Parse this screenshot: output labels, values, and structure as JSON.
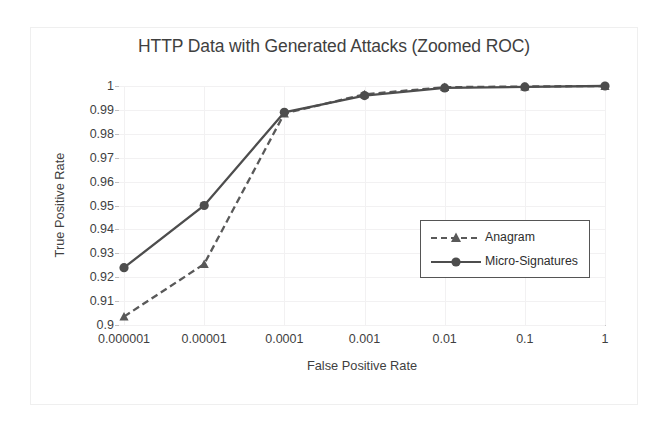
{
  "chart_data": {
    "type": "line",
    "title": "HTTP Data with Generated Attacks (Zoomed ROC)",
    "xlabel": "False Positive Rate",
    "ylabel": "True Positive Rate",
    "xscale": "log",
    "x": [
      1e-06,
      1e-05,
      0.0001,
      0.001,
      0.01,
      0.1,
      1
    ],
    "xtick_labels": [
      "0.000001",
      "0.00001",
      "0.0001",
      "0.001",
      "0.01",
      "0.1",
      "1"
    ],
    "ytick_labels": [
      "1",
      "0.99",
      "0.98",
      "0.97",
      "0.96",
      "0.95",
      "0.94",
      "0.93",
      "0.92",
      "0.91",
      "0.9"
    ],
    "ytick_values": [
      1,
      0.99,
      0.98,
      0.97,
      0.96,
      0.95,
      0.94,
      0.93,
      0.92,
      0.91,
      0.9
    ],
    "ylim": [
      0.9,
      1.0
    ],
    "grid": true,
    "legend_position": "center-right",
    "series": [
      {
        "name": "Anagram",
        "linestyle": "dashed",
        "marker": "triangle",
        "color": "#595959",
        "values": [
          0.9035,
          0.9255,
          0.9885,
          0.9965,
          0.9995,
          0.9998,
          1.0
        ]
      },
      {
        "name": "Micro-Signatures",
        "linestyle": "solid",
        "marker": "circle",
        "color": "#4d4d4d",
        "values": [
          0.924,
          0.95,
          0.989,
          0.996,
          0.9992,
          0.9996,
          1.0
        ]
      }
    ]
  },
  "legend": {
    "entries": [
      {
        "label": "Anagram"
      },
      {
        "label": "Micro-Signatures"
      }
    ]
  },
  "colors": {
    "text": "#3f3f3f",
    "grid": "#f2f1f2",
    "axis": "#c8c7c8",
    "series_anagram": "#595959",
    "series_micro": "#4d4d4d",
    "frame": "#efefef"
  }
}
